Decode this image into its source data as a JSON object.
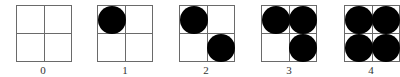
{
  "figure": {
    "panels": [
      {
        "label": "0",
        "left": 16,
        "filled_cells": []
      },
      {
        "label": "1",
        "left": 97,
        "filled_cells": [
          "top-left"
        ]
      },
      {
        "label": "2",
        "left": 179,
        "filled_cells": [
          "top-left",
          "bottom-right"
        ]
      },
      {
        "label": "3",
        "left": 261,
        "filled_cells": [
          "top-left",
          "top-right",
          "bottom-right"
        ]
      },
      {
        "label": "4",
        "left": 344,
        "filled_cells": [
          "top-left",
          "top-right",
          "bottom-left",
          "bottom-right"
        ]
      }
    ],
    "colors": {
      "grid_line": "#6a6a6a",
      "dot": "#000000",
      "label": "#333333",
      "background": "#ffffff"
    }
  }
}
